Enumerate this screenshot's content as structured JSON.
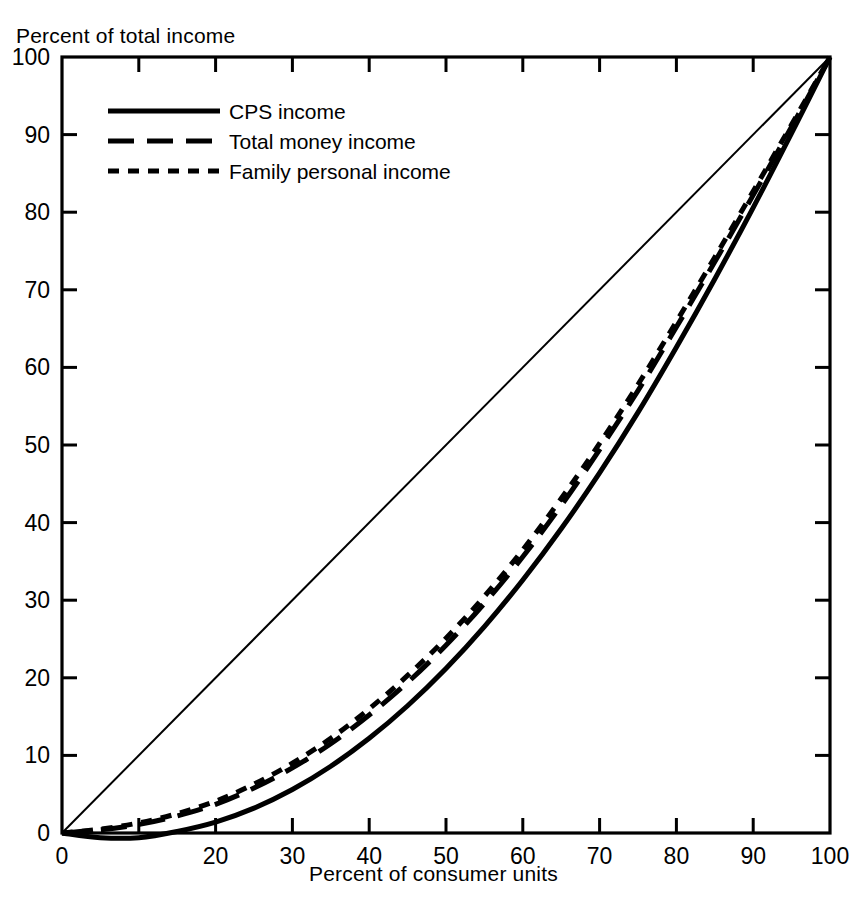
{
  "chart_data": {
    "type": "line",
    "title": "",
    "xlabel": "Percent of consumer units",
    "ylabel": "Percent of total income",
    "xlim": [
      0,
      100
    ],
    "ylim": [
      0,
      100
    ],
    "grid": false,
    "legend_position": "upper left",
    "xticks": [
      0,
      10,
      20,
      30,
      40,
      50,
      60,
      70,
      80,
      90,
      100
    ],
    "xtick_labels": [
      "0",
      "",
      "20",
      "30",
      "40",
      "50",
      "60",
      "70",
      "80",
      "90",
      "100"
    ],
    "yticks": [
      0,
      10,
      20,
      30,
      40,
      50,
      60,
      70,
      80,
      90,
      100
    ],
    "ytick_labels": [
      "0",
      "10",
      "20",
      "30",
      "40",
      "50",
      "60",
      "70",
      "80",
      "90",
      "100"
    ],
    "annotations": [
      "Diagonal line of perfect equality from (0,0) to (100,100)"
    ],
    "x": [
      0,
      5,
      10,
      15,
      20,
      25,
      30,
      35,
      40,
      45,
      50,
      55,
      60,
      65,
      70,
      75,
      80,
      85,
      90,
      95,
      100
    ],
    "series": [
      {
        "name": "CPS income",
        "style": "solid",
        "color": "#000000",
        "values": [
          0,
          -0.6,
          -0.6,
          0.2,
          1.4,
          3.2,
          5.6,
          8.6,
          12.2,
          16.4,
          21.2,
          26.6,
          32.6,
          39.2,
          46.4,
          54.2,
          62.6,
          71.4,
          80.6,
          90.2,
          100
        ]
      },
      {
        "name": "Total money income",
        "style": "long-dash",
        "color": "#000000",
        "values": [
          0,
          0.4,
          1.1,
          2.2,
          3.7,
          5.8,
          8.4,
          11.5,
          15.2,
          19.4,
          24.2,
          29.6,
          35.6,
          42.2,
          49.4,
          57.0,
          65.2,
          73.6,
          82.2,
          91.0,
          100
        ]
      },
      {
        "name": "Family personal income",
        "style": "short-dash",
        "color": "#000000",
        "values": [
          0,
          0.5,
          1.3,
          2.5,
          4.1,
          6.3,
          9.0,
          12.2,
          16.0,
          20.3,
          25.1,
          30.5,
          36.5,
          43.1,
          50.2,
          57.8,
          65.9,
          74.2,
          82.7,
          91.3,
          100
        ]
      }
    ]
  },
  "legend": {
    "items": [
      {
        "label": "CPS income",
        "style": "solid"
      },
      {
        "label": "Total money income",
        "style": "long-dash"
      },
      {
        "label": "Family personal income",
        "style": "short-dash"
      }
    ]
  }
}
